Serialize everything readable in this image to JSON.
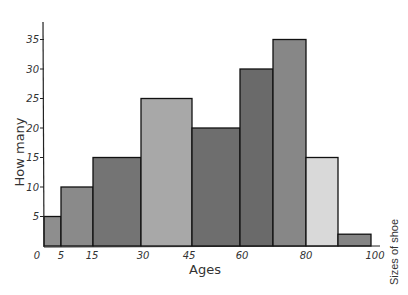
{
  "chart_data": {
    "type": "bar",
    "subtype": "histogram",
    "title": "",
    "xlabel": "Ages",
    "ylabel": "How many",
    "side_label": "Sizes of shoe",
    "x_ticks": [
      0,
      5,
      15,
      30,
      45,
      60,
      80,
      100
    ],
    "y_ticks": [
      5,
      10,
      15,
      20,
      25,
      30,
      35
    ],
    "ylim": [
      0,
      37
    ],
    "grid": false,
    "legend": null,
    "bins": [
      {
        "from": 0,
        "to": 5,
        "value": 5,
        "color": "#8e8e8e"
      },
      {
        "from": 5,
        "to": 15,
        "value": 10,
        "color": "#8a8a8a"
      },
      {
        "from": 15,
        "to": 30,
        "value": 15,
        "color": "#747474"
      },
      {
        "from": 30,
        "to": 45,
        "value": 25,
        "color": "#a8a8a8"
      },
      {
        "from": 45,
        "to": 60,
        "value": 20,
        "color": "#6e6e6e"
      },
      {
        "from": 60,
        "to": 70,
        "value": 30,
        "color": "#6a6a6a"
      },
      {
        "from": 70,
        "to": 80,
        "value": 35,
        "color": "#878787"
      },
      {
        "from": 80,
        "to": 90,
        "value": 15,
        "color": "#d9d9d9"
      },
      {
        "from": 90,
        "to": 100,
        "value": 2,
        "color": "#848484"
      }
    ],
    "values": [
      5,
      10,
      15,
      25,
      20,
      30,
      35,
      15,
      2
    ]
  },
  "layout": {
    "bar_edges_px": [
      44,
      61,
      93,
      141,
      192,
      240,
      273,
      306,
      338,
      371
    ],
    "baseline_y": 246,
    "px_per_unit": 5.9,
    "axis_x": 44,
    "x_tick_label_px": {
      "0": 37,
      "5": 61,
      "15": 92,
      "30": 143,
      "45": 189,
      "60": 242,
      "80": 306,
      "100": 375
    }
  }
}
